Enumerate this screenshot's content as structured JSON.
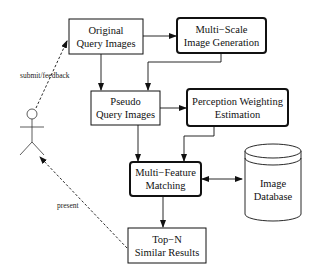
{
  "diagram": {
    "nodes": [
      {
        "id": "original",
        "lines": [
          "Original",
          "Query Images"
        ],
        "style": "plain"
      },
      {
        "id": "multiscale",
        "lines": [
          "Multi−Scale",
          "Image Generation"
        ],
        "style": "bold-rounded"
      },
      {
        "id": "pseudo",
        "lines": [
          "Pseudo",
          "Query Images"
        ],
        "style": "plain"
      },
      {
        "id": "perception",
        "lines": [
          "Perception Weighting",
          "Estimation"
        ],
        "style": "bold-rounded"
      },
      {
        "id": "matching",
        "lines": [
          "Multi−Feature",
          "Matching"
        ],
        "style": "bold-rounded"
      },
      {
        "id": "topn",
        "lines": [
          "Top−N",
          "Similar Results"
        ],
        "style": "plain"
      },
      {
        "id": "database",
        "lines": [
          "Image",
          "Database"
        ],
        "style": "cylinder"
      },
      {
        "id": "user",
        "lines": [],
        "style": "actor"
      }
    ],
    "edges": [
      {
        "from": "original",
        "to": "multiscale",
        "style": "solid"
      },
      {
        "from": "original",
        "to": "pseudo",
        "style": "solid"
      },
      {
        "from": "multiscale",
        "to": "pseudo",
        "style": "solid"
      },
      {
        "from": "pseudo",
        "to": "perception",
        "style": "solid"
      },
      {
        "from": "pseudo",
        "to": "matching",
        "style": "solid"
      },
      {
        "from": "perception",
        "to": "matching",
        "style": "solid"
      },
      {
        "from": "matching",
        "to": "database",
        "style": "solid-bidirectional"
      },
      {
        "from": "matching",
        "to": "topn",
        "style": "solid"
      },
      {
        "from": "user",
        "to": "original",
        "style": "dashed",
        "label": "submit/feedback"
      },
      {
        "from": "topn",
        "to": "user",
        "style": "dashed",
        "label": "present"
      }
    ]
  }
}
